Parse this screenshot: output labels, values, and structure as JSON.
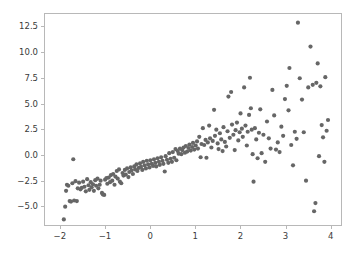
{
  "chart_data": {
    "type": "scatter",
    "title": "",
    "xlabel": "",
    "ylabel": "",
    "xlim": [
      -2.35,
      4.25
    ],
    "ylim": [
      -6.9,
      13.8
    ],
    "grid": false,
    "legend": null,
    "marker": {
      "color": "#666666",
      "size_px": 4.2,
      "shape": "circle",
      "alpha": 1.0
    },
    "xticks": [
      -2,
      -1,
      0,
      1,
      2,
      3,
      4
    ],
    "xtick_labels": [
      "−2",
      "−1",
      "0",
      "1",
      "2",
      "3",
      "4"
    ],
    "yticks": [
      -5.0,
      -2.5,
      0.0,
      2.5,
      5.0,
      7.5,
      10.0,
      12.5
    ],
    "ytick_labels": [
      "−5.0",
      "−2.5",
      "0.0",
      "2.5",
      "5.0",
      "7.5",
      "10.0",
      "12.5"
    ],
    "n_points": 200,
    "points": [
      [
        -1.93,
        -6.35
      ],
      [
        -1.9,
        -5.1
      ],
      [
        -1.88,
        -3.55
      ],
      [
        -1.86,
        -2.95
      ],
      [
        -1.83,
        -3.05
      ],
      [
        -1.8,
        -4.55
      ],
      [
        -1.77,
        -4.6
      ],
      [
        -1.74,
        -2.8
      ],
      [
        -1.72,
        -0.45
      ],
      [
        -1.7,
        -4.5
      ],
      [
        -1.67,
        -2.6
      ],
      [
        -1.64,
        -4.55
      ],
      [
        -1.62,
        -3.3
      ],
      [
        -1.59,
        -2.75
      ],
      [
        -1.56,
        -3.4
      ],
      [
        -1.53,
        -3.25
      ],
      [
        -1.5,
        -2.65
      ],
      [
        -1.47,
        -3.15
      ],
      [
        -1.44,
        -3.6
      ],
      [
        -1.41,
        -2.4
      ],
      [
        -1.38,
        -3.0
      ],
      [
        -1.36,
        -3.45
      ],
      [
        -1.33,
        -2.7
      ],
      [
        -1.31,
        -3.2
      ],
      [
        -1.28,
        -2.9
      ],
      [
        -1.26,
        -3.55
      ],
      [
        -1.23,
        -2.5
      ],
      [
        -1.21,
        -3.05
      ],
      [
        -1.18,
        -2.35
      ],
      [
        -1.16,
        -3.3
      ],
      [
        -1.13,
        -2.95
      ],
      [
        -1.11,
        -2.55
      ],
      [
        -1.08,
        -3.75
      ],
      [
        -1.06,
        -3.9
      ],
      [
        -1.03,
        -3.95
      ],
      [
        -1.01,
        -2.45
      ],
      [
        -0.98,
        -2.3
      ],
      [
        -0.96,
        -2.85
      ],
      [
        -0.93,
        -2.25
      ],
      [
        -0.9,
        -2.7
      ],
      [
        -0.88,
        -2.0
      ],
      [
        -0.85,
        -2.55
      ],
      [
        -0.83,
        -1.9
      ],
      [
        -0.8,
        -2.95
      ],
      [
        -0.78,
        -2.15
      ],
      [
        -0.75,
        -1.6
      ],
      [
        -0.73,
        -2.35
      ],
      [
        -0.7,
        -1.45
      ],
      [
        -0.68,
        -2.65
      ],
      [
        -0.65,
        -2.8
      ],
      [
        -0.62,
        -1.8
      ],
      [
        -0.6,
        -2.05
      ],
      [
        -0.57,
        -1.5
      ],
      [
        -0.55,
        -1.95
      ],
      [
        -0.52,
        -1.35
      ],
      [
        -0.49,
        -2.2
      ],
      [
        -0.47,
        -1.7
      ],
      [
        -0.44,
        -1.25
      ],
      [
        -0.42,
        -1.55
      ],
      [
        -0.39,
        -1.9
      ],
      [
        -0.36,
        -1.15
      ],
      [
        -0.34,
        -1.45
      ],
      [
        -0.31,
        -0.95
      ],
      [
        -0.29,
        -1.6
      ],
      [
        -0.26,
        -1.3
      ],
      [
        -0.23,
        -0.85
      ],
      [
        -0.21,
        -1.2
      ],
      [
        -0.18,
        -1.5
      ],
      [
        -0.16,
        -0.7
      ],
      [
        -0.13,
        -1.05
      ],
      [
        -0.1,
        -1.35
      ],
      [
        -0.08,
        -0.6
      ],
      [
        -0.05,
        -0.95
      ],
      [
        -0.02,
        -1.25
      ],
      [
        0.0,
        -0.55
      ],
      [
        0.03,
        -0.9
      ],
      [
        0.06,
        -1.1
      ],
      [
        0.08,
        -0.45
      ],
      [
        0.11,
        -0.8
      ],
      [
        0.13,
        -1.15
      ],
      [
        0.16,
        -0.35
      ],
      [
        0.19,
        -0.7
      ],
      [
        0.21,
        -1.0
      ],
      [
        0.24,
        -0.25
      ],
      [
        0.27,
        -0.6
      ],
      [
        0.29,
        -0.9
      ],
      [
        0.32,
        -1.65
      ],
      [
        0.34,
        -0.15
      ],
      [
        0.37,
        -0.5
      ],
      [
        0.4,
        -0.8
      ],
      [
        0.42,
        0.15
      ],
      [
        0.45,
        -0.4
      ],
      [
        0.48,
        -0.7
      ],
      [
        0.5,
        0.25
      ],
      [
        0.53,
        -0.3
      ],
      [
        0.56,
        0.55
      ],
      [
        0.58,
        -0.55
      ],
      [
        0.61,
        0.35
      ],
      [
        0.63,
        0.1
      ],
      [
        0.66,
        0.6
      ],
      [
        0.69,
        0.05
      ],
      [
        0.71,
        0.45
      ],
      [
        0.74,
        0.7
      ],
      [
        0.77,
        0.2
      ],
      [
        0.79,
        0.85
      ],
      [
        0.82,
        0.3
      ],
      [
        0.85,
        0.65
      ],
      [
        0.87,
        1.0
      ],
      [
        0.9,
        0.4
      ],
      [
        0.93,
        0.75
      ],
      [
        0.95,
        1.15
      ],
      [
        0.98,
        0.5
      ],
      [
        1.01,
        0.9
      ],
      [
        1.04,
        1.3
      ],
      [
        1.06,
        0.6
      ],
      [
        1.09,
        1.75
      ],
      [
        1.12,
        -0.25
      ],
      [
        1.14,
        1.05
      ],
      [
        1.17,
        2.6
      ],
      [
        1.2,
        0.95
      ],
      [
        1.23,
        1.45
      ],
      [
        1.25,
        -0.3
      ],
      [
        1.28,
        1.2
      ],
      [
        1.31,
        2.85
      ],
      [
        1.33,
        1.6
      ],
      [
        1.36,
        0.7
      ],
      [
        1.39,
        1.35
      ],
      [
        1.42,
        4.4
      ],
      [
        1.44,
        1.85
      ],
      [
        1.47,
        2.45
      ],
      [
        1.5,
        1.1
      ],
      [
        1.52,
        0.55
      ],
      [
        1.55,
        2.1
      ],
      [
        1.58,
        1.5
      ],
      [
        1.61,
        0.35
      ],
      [
        1.63,
        2.7
      ],
      [
        1.66,
        1.25
      ],
      [
        1.69,
        0.8
      ],
      [
        1.72,
        2.3
      ],
      [
        1.74,
        5.7
      ],
      [
        1.77,
        1.65
      ],
      [
        1.8,
        6.15
      ],
      [
        1.82,
        2.95
      ],
      [
        1.85,
        1.95
      ],
      [
        1.88,
        0.45
      ],
      [
        1.9,
        2.4
      ],
      [
        1.93,
        3.15
      ],
      [
        1.96,
        1.4
      ],
      [
        1.99,
        2.2
      ],
      [
        2.01,
        4.05
      ],
      [
        2.04,
        2.55
      ],
      [
        2.06,
        1.75
      ],
      [
        2.09,
        6.6
      ],
      [
        2.12,
        2.85
      ],
      [
        2.15,
        0.9
      ],
      [
        2.17,
        2.25
      ],
      [
        2.2,
        3.9
      ],
      [
        2.22,
        7.55
      ],
      [
        2.24,
        4.55
      ],
      [
        2.26,
        2.45
      ],
      [
        2.28,
        0.05
      ],
      [
        2.3,
        -2.65
      ],
      [
        2.33,
        2.6
      ],
      [
        2.36,
        1.5
      ],
      [
        2.39,
        -0.35
      ],
      [
        2.42,
        2.15
      ],
      [
        2.45,
        4.45
      ],
      [
        2.48,
        0.15
      ],
      [
        2.52,
        1.95
      ],
      [
        2.56,
        -0.7
      ],
      [
        2.6,
        3.25
      ],
      [
        2.64,
        1.6
      ],
      [
        2.68,
        0.6
      ],
      [
        2.72,
        6.35
      ],
      [
        2.76,
        3.85
      ],
      [
        2.8,
        0.5
      ],
      [
        2.84,
        1.2
      ],
      [
        2.88,
        0.25
      ],
      [
        2.92,
        2.75
      ],
      [
        2.96,
        1.85
      ],
      [
        3.0,
        5.45
      ],
      [
        3.04,
        6.75
      ],
      [
        3.08,
        4.35
      ],
      [
        3.1,
        8.5
      ],
      [
        3.14,
        0.95
      ],
      [
        3.18,
        -1.05
      ],
      [
        3.22,
        2.25
      ],
      [
        3.26,
        1.55
      ],
      [
        3.29,
        12.95
      ],
      [
        3.33,
        7.5
      ],
      [
        3.38,
        5.4
      ],
      [
        3.42,
        2.2
      ],
      [
        3.47,
        -2.55
      ],
      [
        3.52,
        6.6
      ],
      [
        3.57,
        10.6
      ],
      [
        3.62,
        6.85
      ],
      [
        3.65,
        -5.55
      ],
      [
        3.68,
        -4.75
      ],
      [
        3.7,
        7.05
      ],
      [
        3.73,
        8.95
      ],
      [
        3.76,
        -0.15
      ],
      [
        3.79,
        6.7
      ],
      [
        3.82,
        2.9
      ],
      [
        3.85,
        1.7
      ],
      [
        3.88,
        -0.7
      ],
      [
        3.9,
        7.6
      ],
      [
        3.93,
        2.35
      ],
      [
        3.96,
        3.4
      ]
    ]
  }
}
